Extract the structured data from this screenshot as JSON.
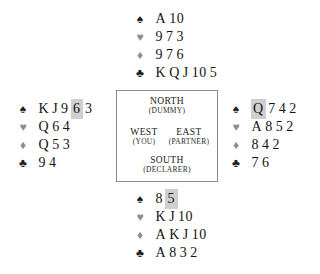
{
  "diagram": {
    "kind": "bridge-hand-diagram",
    "background_color": "#ffffff",
    "highlight_color": "#cfcfcf",
    "suit_symbols": {
      "spade": "♠",
      "heart": "♥",
      "diamond": "♦",
      "club": "♣"
    },
    "suit_colors": {
      "spade": "#1c1c1c",
      "heart": "#8d8d8d",
      "diamond": "#8d8d8d",
      "club": "#1c1c1c"
    }
  },
  "compass": {
    "north": {
      "name": "NORTH",
      "role": "(DUMMY)"
    },
    "west": {
      "name": "WEST",
      "role": "(YOU)"
    },
    "east": {
      "name": "EAST",
      "role": "(PARTNER)"
    },
    "south": {
      "name": "SOUTH",
      "role": "(DECLARER)"
    }
  },
  "hands": {
    "north": {
      "seat": "North",
      "suits": [
        {
          "suit": "spade",
          "symbol": "♠",
          "tone": "dark",
          "cards": [
            {
              "rank": "A",
              "highlight": false
            },
            {
              "rank": "10",
              "highlight": false
            }
          ]
        },
        {
          "suit": "heart",
          "symbol": "♥",
          "tone": "light",
          "cards": [
            {
              "rank": "9",
              "highlight": false
            },
            {
              "rank": "7",
              "highlight": false
            },
            {
              "rank": "3",
              "highlight": false
            }
          ]
        },
        {
          "suit": "diamond",
          "symbol": "♦",
          "tone": "light",
          "cards": [
            {
              "rank": "9",
              "highlight": false
            },
            {
              "rank": "7",
              "highlight": false
            },
            {
              "rank": "6",
              "highlight": false
            }
          ]
        },
        {
          "suit": "club",
          "symbol": "♣",
          "tone": "dark",
          "cards": [
            {
              "rank": "K",
              "highlight": false
            },
            {
              "rank": "Q",
              "highlight": false
            },
            {
              "rank": "J",
              "highlight": false
            },
            {
              "rank": "10",
              "highlight": false
            },
            {
              "rank": "5",
              "highlight": false
            }
          ]
        }
      ]
    },
    "west": {
      "seat": "West",
      "suits": [
        {
          "suit": "spade",
          "symbol": "♠",
          "tone": "dark",
          "cards": [
            {
              "rank": "K",
              "highlight": false
            },
            {
              "rank": "J",
              "highlight": false
            },
            {
              "rank": "9",
              "highlight": false
            },
            {
              "rank": "6",
              "highlight": true
            },
            {
              "rank": "3",
              "highlight": false
            }
          ]
        },
        {
          "suit": "heart",
          "symbol": "♥",
          "tone": "light",
          "cards": [
            {
              "rank": "Q",
              "highlight": false
            },
            {
              "rank": "6",
              "highlight": false
            },
            {
              "rank": "4",
              "highlight": false
            }
          ]
        },
        {
          "suit": "diamond",
          "symbol": "♦",
          "tone": "light",
          "cards": [
            {
              "rank": "Q",
              "highlight": false
            },
            {
              "rank": "5",
              "highlight": false
            },
            {
              "rank": "3",
              "highlight": false
            }
          ]
        },
        {
          "suit": "club",
          "symbol": "♣",
          "tone": "dark",
          "cards": [
            {
              "rank": "9",
              "highlight": false
            },
            {
              "rank": "4",
              "highlight": false
            }
          ]
        }
      ]
    },
    "east": {
      "seat": "East",
      "suits": [
        {
          "suit": "spade",
          "symbol": "♠",
          "tone": "dark",
          "cards": [
            {
              "rank": "Q",
              "highlight": true
            },
            {
              "rank": "7",
              "highlight": false
            },
            {
              "rank": "4",
              "highlight": false
            },
            {
              "rank": "2",
              "highlight": false
            }
          ]
        },
        {
          "suit": "heart",
          "symbol": "♥",
          "tone": "light",
          "cards": [
            {
              "rank": "A",
              "highlight": false
            },
            {
              "rank": "8",
              "highlight": false
            },
            {
              "rank": "5",
              "highlight": false
            },
            {
              "rank": "2",
              "highlight": false
            }
          ]
        },
        {
          "suit": "diamond",
          "symbol": "♦",
          "tone": "light",
          "cards": [
            {
              "rank": "8",
              "highlight": false
            },
            {
              "rank": "4",
              "highlight": false
            },
            {
              "rank": "2",
              "highlight": false
            }
          ]
        },
        {
          "suit": "club",
          "symbol": "♣",
          "tone": "dark",
          "cards": [
            {
              "rank": "7",
              "highlight": false
            },
            {
              "rank": "6",
              "highlight": false
            }
          ]
        }
      ]
    },
    "south": {
      "seat": "South",
      "suits": [
        {
          "suit": "spade",
          "symbol": "♠",
          "tone": "dark",
          "cards": [
            {
              "rank": "8",
              "highlight": false
            },
            {
              "rank": "5",
              "highlight": true
            }
          ]
        },
        {
          "suit": "heart",
          "symbol": "♥",
          "tone": "light",
          "cards": [
            {
              "rank": "K",
              "highlight": false
            },
            {
              "rank": "J",
              "highlight": false
            },
            {
              "rank": "10",
              "highlight": false
            }
          ]
        },
        {
          "suit": "diamond",
          "symbol": "♦",
          "tone": "light",
          "cards": [
            {
              "rank": "A",
              "highlight": false
            },
            {
              "rank": "K",
              "highlight": false
            },
            {
              "rank": "J",
              "highlight": false
            },
            {
              "rank": "10",
              "highlight": false
            }
          ]
        },
        {
          "suit": "club",
          "symbol": "♣",
          "tone": "dark",
          "cards": [
            {
              "rank": "A",
              "highlight": false
            },
            {
              "rank": "8",
              "highlight": false
            },
            {
              "rank": "3",
              "highlight": false
            },
            {
              "rank": "2",
              "highlight": false
            }
          ]
        }
      ]
    }
  }
}
